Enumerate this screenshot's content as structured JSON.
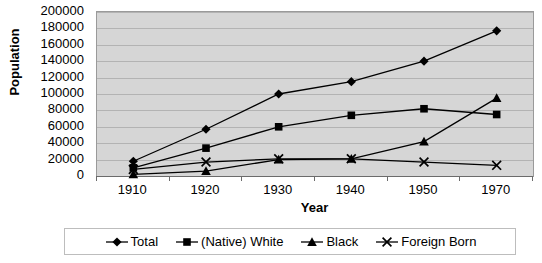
{
  "chart_data": {
    "type": "line",
    "title": "",
    "xlabel": "Year",
    "ylabel": "Population",
    "categories": [
      "1910",
      "1920",
      "1930",
      "1940",
      "1950",
      "1970"
    ],
    "ylim": [
      0,
      200000
    ],
    "ytick_step": 20000,
    "yticks": [
      "200000",
      "180000",
      "160000",
      "140000",
      "120000",
      "100000",
      "80000",
      "60000",
      "40000",
      "20000",
      "0"
    ],
    "grid": true,
    "legend_position": "bottom",
    "series": [
      {
        "name": "Total",
        "marker": "diamond",
        "color": "#000000",
        "values": [
          18000,
          57000,
          100000,
          115000,
          140000,
          177000
        ]
      },
      {
        "name": "(Native) White",
        "marker": "square",
        "color": "#000000",
        "values": [
          10000,
          34000,
          60000,
          74000,
          82000,
          75000
        ]
      },
      {
        "name": "Black",
        "marker": "triangle",
        "color": "#000000",
        "values": [
          2000,
          6000,
          20000,
          21000,
          42000,
          95000
        ]
      },
      {
        "name": "Foreign Born",
        "marker": "cross",
        "color": "#000000",
        "values": [
          8000,
          17000,
          21000,
          21000,
          17000,
          13000
        ]
      }
    ]
  },
  "axes": {
    "y_title": "Population",
    "x_title": "Year"
  },
  "colors": {
    "plot_background": "#d6d6d6",
    "gridline": "#b3b3b3",
    "plot_border": "#9a9a9a",
    "series": "#000000",
    "page_background": "#ffffff"
  }
}
